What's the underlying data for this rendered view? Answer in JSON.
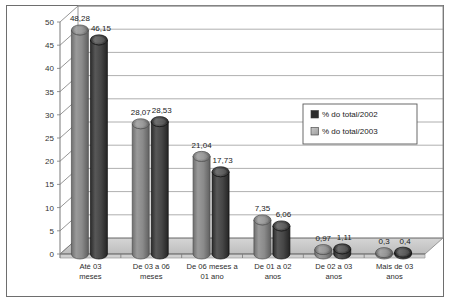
{
  "chart_data": {
    "type": "bar",
    "title": "",
    "subtitle": "",
    "xlabel": "",
    "ylabel": "",
    "ylim": [
      0,
      50
    ],
    "ytick_step": 5,
    "yticks": [
      "0",
      "5",
      "10",
      "15",
      "20",
      "25",
      "30",
      "35",
      "40",
      "45",
      "50"
    ],
    "grid": true,
    "legend_position": "right-middle",
    "style": "3d-cylinder",
    "decimal_separator": ",",
    "categories": [
      "Até 03 meses",
      "De 03 a 06 meses",
      "De 06 meses a 01 ano",
      "De 01 a 02 anos",
      "De 02 a 03 anos",
      "Mais de 03 anos"
    ],
    "categories_lines": [
      [
        "Até 03",
        "meses"
      ],
      [
        "De 03 a 06",
        "meses"
      ],
      [
        "De 06 meses a",
        "01 ano"
      ],
      [
        "De 01 a 02",
        "anos"
      ],
      [
        "De 02 a 03",
        "anos"
      ],
      [
        "Mais de 03",
        "anos"
      ]
    ],
    "series": [
      {
        "name": "% do total/2002",
        "color": "#808080",
        "values": [
          48.28,
          28.07,
          21.04,
          7.35,
          0.97,
          0.3
        ],
        "labels": [
          "48,28",
          "28,07",
          "21,04",
          "7,35",
          "0,97",
          "0,3"
        ]
      },
      {
        "name": "% do total/2003",
        "color": "#404040",
        "values": [
          46.15,
          28.53,
          17.73,
          6.06,
          1.11,
          0.4
        ],
        "labels": [
          "46,15",
          "28,53",
          "17,73",
          "6,06",
          "1,11",
          "0,4"
        ]
      }
    ]
  },
  "legend": {
    "items": [
      {
        "label": "% do total/2002",
        "swatch": "#2e2e2e"
      },
      {
        "label": "% do total/2003",
        "swatch": "#b0b0b0"
      }
    ]
  },
  "colors": {
    "frame_border": "#6e6e6e",
    "plot_background": "#ffffff",
    "gridline": "#9a9a9a",
    "floor": "#c9c9c9",
    "series_2002_bar": "#808080",
    "series_2003_bar": "#404040",
    "page_background": "#ffffff"
  }
}
